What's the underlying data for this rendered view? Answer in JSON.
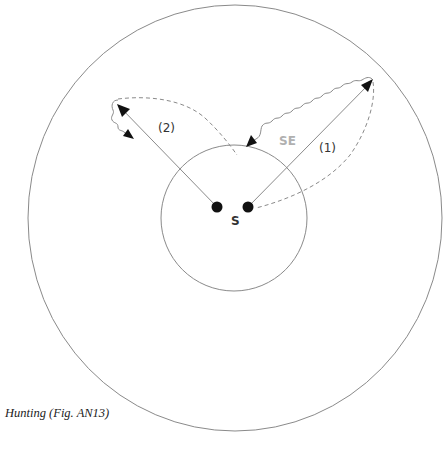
{
  "diagram": {
    "caption": "Hunting (Fig. AN13)",
    "center_label": "S",
    "search_edge_label": "SE",
    "path_labels": {
      "path1": "(1)",
      "path2": "(2)"
    },
    "colors": {
      "line": "#8a8a8a",
      "dark": "#111111",
      "se_label": "#b0b0b0",
      "text": "#333333"
    },
    "elements": {
      "outer_circle": "outer boundary",
      "inner_circle": "inner boundary around S",
      "origin_points": 2,
      "outbound_arrows": [
        "(1)",
        "(2)"
      ],
      "return_paths": "dashed",
      "wandering_paths": "wavy"
    }
  }
}
